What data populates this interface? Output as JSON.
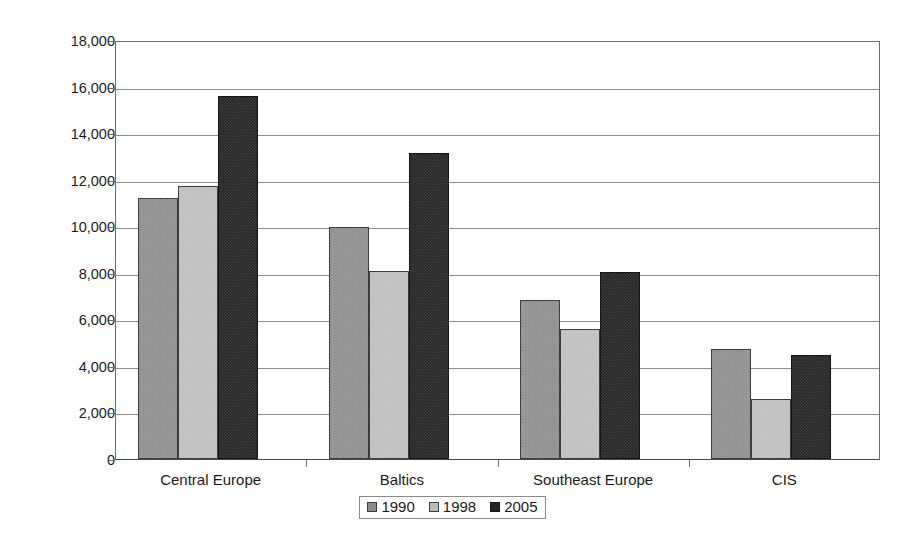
{
  "chart_data": {
    "type": "bar",
    "title": "",
    "xlabel": "",
    "ylabel": "Constant 2000 International US$",
    "categories": [
      "Central Europe",
      "Baltics",
      "Southeast Europe",
      "CIS"
    ],
    "series": [
      {
        "name": "1990",
        "color": "#8d8d8d",
        "values": [
          11230,
          9950,
          6830,
          4710
        ]
      },
      {
        "name": "1998",
        "color": "#bcbcbc",
        "values": [
          11750,
          8080,
          5570,
          2590
        ]
      },
      {
        "name": "2005",
        "color": "#262626",
        "values": [
          15610,
          13150,
          8050,
          4450
        ]
      }
    ],
    "ylim": [
      0,
      18000
    ],
    "ytick_step": 2000,
    "ytick_labels": [
      "18,000",
      "16,000",
      "14,000",
      "12,000",
      "10,000",
      "8,000",
      "6,000",
      "4,000",
      "2,000",
      "0"
    ],
    "ytick_values": [
      18000,
      16000,
      14000,
      12000,
      10000,
      8000,
      6000,
      4000,
      2000,
      0
    ],
    "grid": true,
    "legend_position": "bottom-center",
    "legend_entries": [
      "1990",
      "1998",
      "2005"
    ]
  }
}
